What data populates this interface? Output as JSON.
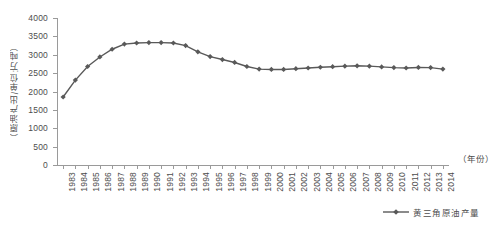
{
  "chart_data": {
    "type": "line",
    "title": "",
    "xlabel": "（年份）",
    "ylabel": "（原油产出/单位:万吨）",
    "ylim": [
      0,
      4000
    ],
    "ytick_step": 500,
    "yticks": [
      0,
      500,
      1000,
      1500,
      2000,
      2500,
      3000,
      3500,
      4000
    ],
    "ytick_labels": [
      "0",
      "500",
      "1000",
      "1500",
      "2000",
      "2500",
      "3000",
      "3500",
      "4000"
    ],
    "grid": false,
    "legend_position": "bottom-right",
    "categories": [
      "1983",
      "1984",
      "1985",
      "1986",
      "1987",
      "1988",
      "1989",
      "1990",
      "1991",
      "1992",
      "1993",
      "1994",
      "1995",
      "1996",
      "1997",
      "1998",
      "1999",
      "2000",
      "2001",
      "2002",
      "2003",
      "2004",
      "2005",
      "2006",
      "2007",
      "2008",
      "2009",
      "2010",
      "2011",
      "2012",
      "2013",
      "2014"
    ],
    "series": [
      {
        "name": "黄三角原油产量",
        "color": "#595959",
        "marker": "diamond",
        "values": [
          1850,
          2310,
          2680,
          2940,
          3150,
          3290,
          3320,
          3330,
          3330,
          3320,
          3250,
          3080,
          2950,
          2870,
          2790,
          2680,
          2610,
          2600,
          2600,
          2620,
          2640,
          2660,
          2675,
          2690,
          2700,
          2690,
          2670,
          2650,
          2640,
          2655,
          2650,
          2610
        ]
      }
    ]
  },
  "legend": {
    "entries": [
      {
        "label": "黄三角原油产量",
        "color": "#595959"
      }
    ]
  },
  "axes": {
    "y_title": "（原油产出/单位:万吨）",
    "x_title": "（年份）"
  }
}
